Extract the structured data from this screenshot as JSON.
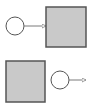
{
  "diagram": {
    "background": "#ffffff",
    "colors": {
      "square_fill": "#c9c9c9",
      "square_stroke": "#555555",
      "circle_fill": "#ffffff",
      "circle_stroke": "#555555",
      "arrow_stroke": "#7a7a7a"
    },
    "panels": [
      {
        "name": "top",
        "circle": {
          "cx": 15,
          "cy": 26,
          "r": 9
        },
        "arrow": {
          "x1": 24,
          "y1": 26,
          "x2": 46,
          "y2": 26
        },
        "square": {
          "x": 46,
          "y": 7,
          "w": 40,
          "h": 40
        },
        "relation": "circle-points-to-square"
      },
      {
        "name": "bottom",
        "square": {
          "x": 6,
          "y": 61,
          "w": 39,
          "h": 41
        },
        "circle": {
          "cx": 60,
          "cy": 80,
          "r": 9
        },
        "arrow": {
          "x1": 69,
          "y1": 80,
          "x2": 86,
          "y2": 80
        },
        "relation": "circle-points-outward"
      }
    ]
  }
}
